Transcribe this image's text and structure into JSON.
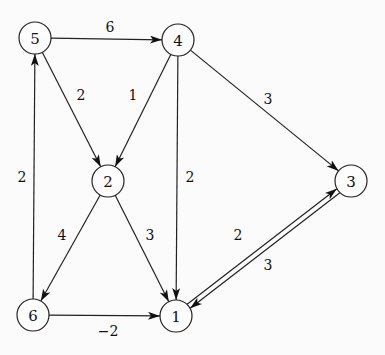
{
  "graph": {
    "type": "directed-weighted",
    "node_radius": 16,
    "nodes": [
      {
        "id": "1",
        "label": "1",
        "x": 176,
        "y": 316
      },
      {
        "id": "2",
        "label": "2",
        "x": 108,
        "y": 181
      },
      {
        "id": "3",
        "label": "3",
        "x": 351,
        "y": 181
      },
      {
        "id": "4",
        "label": "4",
        "x": 178,
        "y": 40
      },
      {
        "id": "5",
        "label": "5",
        "x": 35,
        "y": 38
      },
      {
        "id": "6",
        "label": "6",
        "x": 33,
        "y": 315
      }
    ],
    "edges": [
      {
        "from": "5",
        "to": "4",
        "weight": "6",
        "label_x": 110,
        "label_y": 27,
        "offset": 0
      },
      {
        "from": "5",
        "to": "2",
        "weight": "2",
        "label_x": 81,
        "label_y": 95,
        "offset": 0
      },
      {
        "from": "4",
        "to": "2",
        "weight": "1",
        "label_x": 133,
        "label_y": 95,
        "offset": 0
      },
      {
        "from": "4",
        "to": "3",
        "weight": "3",
        "label_x": 268,
        "label_y": 99,
        "offset": 0
      },
      {
        "from": "4",
        "to": "1",
        "weight": "2",
        "label_x": 190,
        "label_y": 177,
        "offset": 0
      },
      {
        "from": "2",
        "to": "6",
        "weight": "4",
        "label_x": 62,
        "label_y": 235,
        "offset": 0
      },
      {
        "from": "2",
        "to": "1",
        "weight": "3",
        "label_x": 150,
        "label_y": 235,
        "offset": 0
      },
      {
        "from": "6",
        "to": "5",
        "weight": "2",
        "label_x": 22,
        "label_y": 177,
        "offset": 0
      },
      {
        "from": "6",
        "to": "1",
        "weight": "-2",
        "label_x": 108,
        "label_y": 331,
        "offset": 0
      },
      {
        "from": "1",
        "to": "3",
        "weight": "2",
        "label_x": 238,
        "label_y": 235,
        "offset": -2.5
      },
      {
        "from": "3",
        "to": "1",
        "weight": "3",
        "label_x": 268,
        "label_y": 265,
        "offset": -2.5
      }
    ]
  }
}
